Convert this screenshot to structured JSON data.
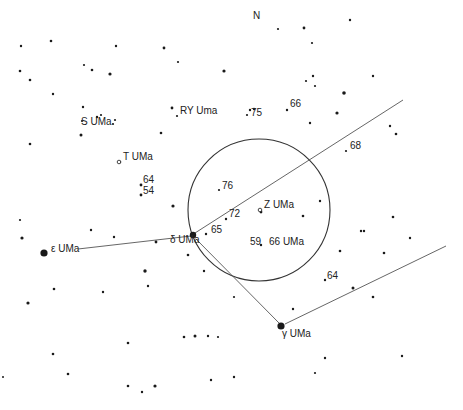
{
  "chart": {
    "title_north": "N",
    "circle": {
      "cx": 259,
      "cy": 210,
      "r": 71
    },
    "lines": [
      {
        "name": "epsilon-delta-line",
        "x1": 78,
        "y1": 249,
        "x2": 191,
        "y2": 236
      },
      {
        "name": "delta-ne-line",
        "x1": 195,
        "y1": 233,
        "x2": 403,
        "y2": 100
      },
      {
        "name": "delta-gamma-line",
        "x1": 196,
        "y1": 239,
        "x2": 279,
        "y2": 323
      },
      {
        "name": "gamma-ne-line",
        "x1": 285,
        "y1": 324,
        "x2": 446,
        "y2": 246
      }
    ],
    "labels": [
      {
        "id": "north",
        "text": "N",
        "x": 253,
        "y": 16
      },
      {
        "id": "s-uma",
        "text": "S UMa",
        "x": 81,
        "y": 122
      },
      {
        "id": "ry-uma",
        "text": "RY Uma",
        "x": 180,
        "y": 111
      },
      {
        "id": "75",
        "text": "75",
        "x": 251,
        "y": 113
      },
      {
        "id": "66-top",
        "text": "66",
        "x": 290,
        "y": 104
      },
      {
        "id": "68",
        "text": "68",
        "x": 350,
        "y": 146
      },
      {
        "id": "t-uma",
        "text": "T UMa",
        "x": 123,
        "y": 157
      },
      {
        "id": "64-left",
        "text": "64",
        "x": 143,
        "y": 180
      },
      {
        "id": "54",
        "text": "54",
        "x": 143,
        "y": 191
      },
      {
        "id": "76",
        "text": "76",
        "x": 222,
        "y": 186
      },
      {
        "id": "z-uma",
        "text": "Z UMa",
        "x": 264,
        "y": 205
      },
      {
        "id": "72",
        "text": "72",
        "x": 229,
        "y": 214
      },
      {
        "id": "65",
        "text": "65",
        "x": 211,
        "y": 230
      },
      {
        "id": "delta-uma",
        "text": "δ UMa",
        "x": 170,
        "y": 240
      },
      {
        "id": "epsilon-uma",
        "text": "ε UMa",
        "x": 51,
        "y": 249
      },
      {
        "id": "59",
        "text": "59",
        "x": 250,
        "y": 242
      },
      {
        "id": "66-uma",
        "text": "66 UMa",
        "x": 269,
        "y": 242
      },
      {
        "id": "64-right",
        "text": "64",
        "x": 327,
        "y": 276
      },
      {
        "id": "gamma-uma",
        "text": "γ UMa",
        "x": 282,
        "y": 334
      }
    ],
    "stars": [
      [
        21,
        46,
        1.2
      ],
      [
        51,
        41,
        1.3
      ],
      [
        116,
        46,
        1.2
      ],
      [
        164,
        48,
        1.4
      ],
      [
        178,
        62,
        1.1
      ],
      [
        278,
        29,
        1.1
      ],
      [
        304,
        28,
        1.4
      ],
      [
        350,
        20,
        1.2
      ],
      [
        20,
        71,
        1.3
      ],
      [
        30,
        80,
        1.3
      ],
      [
        84,
        65,
        1.1
      ],
      [
        92,
        70,
        1.3
      ],
      [
        110,
        74,
        1.6
      ],
      [
        53,
        94,
        1.2
      ],
      [
        83,
        107,
        1.2
      ],
      [
        97,
        117,
        1.2
      ],
      [
        101,
        115,
        1.1
      ],
      [
        113,
        124,
        1.1
      ],
      [
        115,
        120,
        1.1
      ],
      [
        81,
        135,
        1.5
      ],
      [
        82,
        121,
        1.1
      ],
      [
        30,
        144,
        1.3
      ],
      [
        172,
        108,
        1.4
      ],
      [
        177,
        116,
        1.1
      ],
      [
        161,
        133,
        1.3
      ],
      [
        224,
        71,
        1.6
      ],
      [
        312,
        43,
        1.1
      ],
      [
        313,
        76,
        1.2
      ],
      [
        306,
        81,
        1.1
      ],
      [
        315,
        86,
        1.1
      ],
      [
        373,
        76,
        1.2
      ],
      [
        344,
        93,
        1.8
      ],
      [
        337,
        113,
        1.6
      ],
      [
        250,
        110,
        1.2
      ],
      [
        254,
        109,
        1.2
      ],
      [
        247,
        115,
        1.1
      ],
      [
        287,
        110,
        1.2
      ],
      [
        310,
        123,
        1.2
      ],
      [
        390,
        126,
        1.2
      ],
      [
        396,
        134,
        1.3
      ],
      [
        346,
        151,
        1.1
      ],
      [
        120,
        162,
        1.2
      ],
      [
        141,
        185,
        1.4
      ],
      [
        141,
        195,
        1.4
      ],
      [
        219,
        190,
        1.1
      ],
      [
        226,
        219,
        1.2
      ],
      [
        206,
        234,
        1.2
      ],
      [
        261,
        212,
        1.4
      ],
      [
        320,
        201,
        1.2
      ],
      [
        20,
        220,
        1.1
      ],
      [
        22,
        238,
        1.6
      ],
      [
        91,
        230,
        1.2
      ],
      [
        114,
        237,
        1.2
      ],
      [
        156,
        242,
        1.4
      ],
      [
        188,
        255,
        1.3
      ],
      [
        173,
        206,
        1.6
      ],
      [
        261,
        245,
        1.2
      ],
      [
        204,
        271,
        1.2
      ],
      [
        145,
        271,
        1.7
      ],
      [
        148,
        286,
        1.2
      ],
      [
        54,
        289,
        1.3
      ],
      [
        103,
        292,
        1.2
      ],
      [
        28,
        303,
        1.6
      ],
      [
        303,
        216,
        1.3
      ],
      [
        361,
        231,
        1.2
      ],
      [
        364,
        231,
        1.2
      ],
      [
        393,
        217,
        1.3
      ],
      [
        410,
        238,
        1.2
      ],
      [
        340,
        251,
        1.3
      ],
      [
        384,
        253,
        1.3
      ],
      [
        325,
        280,
        1.2
      ],
      [
        353,
        288,
        1.5
      ],
      [
        373,
        297,
        1.3
      ],
      [
        293,
        309,
        1.2
      ],
      [
        128,
        343,
        1.3
      ],
      [
        184,
        337,
        1.3
      ],
      [
        195,
        336,
        1.5
      ],
      [
        208,
        336,
        1.2
      ],
      [
        218,
        337,
        1.1
      ],
      [
        53,
        354,
        1.3
      ],
      [
        68,
        374,
        1.3
      ],
      [
        128,
        386,
        1.3
      ],
      [
        142,
        392,
        1.2
      ],
      [
        155,
        386,
        1.6
      ],
      [
        211,
        380,
        1.2
      ],
      [
        234,
        377,
        1.2
      ],
      [
        325,
        358,
        1.2
      ],
      [
        315,
        373,
        1.1
      ],
      [
        402,
        356,
        1.2
      ],
      [
        234,
        297,
        1.1
      ],
      [
        3,
        377,
        1.0
      ]
    ],
    "major_stars": [
      {
        "name": "epsilon-uma",
        "x": 44,
        "y": 253,
        "r": 3.6
      },
      {
        "name": "delta-uma",
        "x": 193,
        "y": 235,
        "r": 3.2
      },
      {
        "name": "gamma-uma",
        "x": 281,
        "y": 326,
        "r": 3.6
      }
    ],
    "variable_stars": [
      {
        "name": "t-uma",
        "x": 119,
        "y": 162
      },
      {
        "name": "z-uma",
        "x": 260,
        "y": 210
      }
    ],
    "colors": {
      "ink": "#1a1a1a",
      "line": "#555555",
      "background": "#ffffff"
    }
  }
}
